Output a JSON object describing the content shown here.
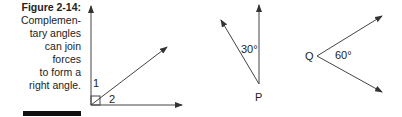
{
  "caption": {
    "title": "Figure 2-14:",
    "lines": [
      "Complemen-",
      "tary angles",
      "can join",
      "forces",
      "to form a",
      "right angle."
    ]
  },
  "diagram": {
    "figure1": {
      "angle_labels": [
        "1",
        "2"
      ],
      "right_angle_marker": true
    },
    "figure2": {
      "vertex_label": "P",
      "angle_label": "30°"
    },
    "figure3": {
      "vertex_label": "Q",
      "angle_label": "60°"
    },
    "line_color": "#333333"
  }
}
